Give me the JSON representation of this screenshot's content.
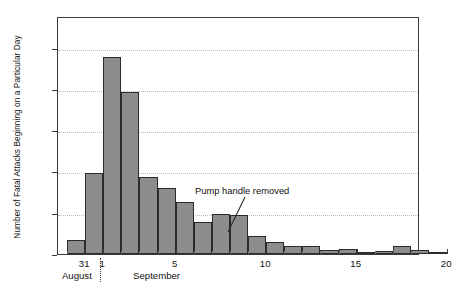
{
  "chart_data": {
    "type": "bar",
    "title": "",
    "subtitle": "",
    "xlabel": "",
    "ylabel": "Number of Fatal Attacks Beginning on a Particular Day",
    "ylim": [
      0,
      173
    ],
    "yticks": [
      0,
      30,
      60,
      90,
      120,
      150
    ],
    "ytick_labels": [
      "0",
      "30",
      "60",
      "90",
      "120",
      "150"
    ],
    "xlim": [
      29.5,
      49.5
    ],
    "xticks": [
      31,
      32,
      36,
      41,
      46,
      51
    ],
    "xtick_labels": [
      "31",
      "1",
      "5",
      "10",
      "15",
      "20"
    ],
    "grid": true,
    "grid_axis": "y",
    "legend": "none",
    "bar_color": "#8d8d8d",
    "bar_edge_color": "#2b2b2b",
    "categories": [
      "Aug 30",
      "Aug 31",
      "Sep 1",
      "Sep 2",
      "Sep 3",
      "Sep 4",
      "Sep 5",
      "Sep 6",
      "Sep 7",
      "Sep 8",
      "Sep 9",
      "Sep 10",
      "Sep 11",
      "Sep 12",
      "Sep 13",
      "Sep 14",
      "Sep 15",
      "Sep 16",
      "Sep 17",
      "Sep 18",
      "Sep 19"
    ],
    "values": [
      10,
      59,
      143,
      118,
      56,
      48,
      38,
      23,
      29,
      28,
      13,
      9,
      6,
      6,
      3,
      4,
      1,
      2,
      6,
      3,
      1
    ],
    "months": [
      {
        "label": "August",
        "center_day": 30.6
      },
      {
        "label": "September",
        "center_day": 35.0
      }
    ],
    "annotations": [
      {
        "text": "Pump handle removed",
        "text_x": 195,
        "text_y": 185,
        "leader_from_x": 245,
        "leader_from_y": 197,
        "leader_to_x": 228,
        "leader_to_y": 232
      }
    ]
  }
}
